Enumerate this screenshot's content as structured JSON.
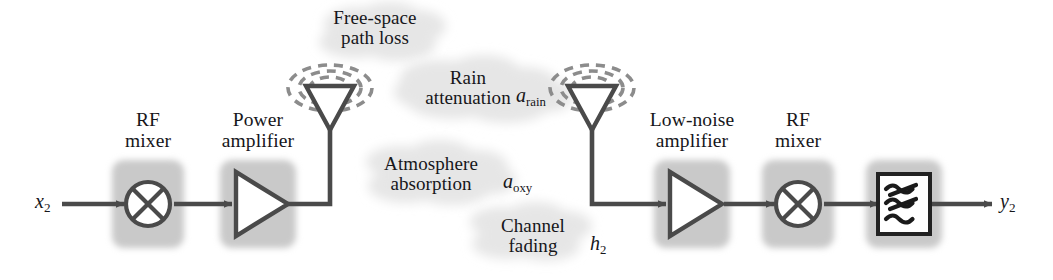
{
  "figure": {
    "kind": "rf-link-block-diagram",
    "background_color": "#ffffff",
    "line_color": "#4a4a4a",
    "block_fill_color": "#c8c8c8",
    "cloud_color": "#e3e3e3",
    "text_color": "#16161a"
  },
  "signals": {
    "input_label": "x",
    "input_subscript": "2",
    "output_label": "y",
    "output_subscript": "2"
  },
  "blocks": [
    {
      "id": "tx-rf-mixer",
      "label": "RF\nmixer",
      "icon": "mixer-circle-x-icon"
    },
    {
      "id": "power-amplifier",
      "label": "Power\namplifier",
      "icon": "amplifier-triangle-icon"
    },
    {
      "id": "low-noise-amplifier",
      "label": "Low-noise\namplifier",
      "icon": "amplifier-triangle-icon"
    },
    {
      "id": "rx-rf-mixer",
      "label": "RF\nmixer",
      "icon": "mixer-circle-x-icon"
    },
    {
      "id": "rx-filter",
      "label": "",
      "icon": "filter-wavy-lines-icon"
    }
  ],
  "antennas": [
    {
      "id": "tx-antenna",
      "name": "transmit-antenna"
    },
    {
      "id": "rx-antenna",
      "name": "receive-antenna"
    }
  ],
  "channel_effects": [
    {
      "id": "free-space-path-loss",
      "label": "Free-space\npath loss",
      "symbol": "",
      "symbol_sub": ""
    },
    {
      "id": "rain-attenuation",
      "label": "Rain\nattenuation",
      "symbol": "a",
      "symbol_sub": "rain"
    },
    {
      "id": "atmosphere-absorption",
      "label": "Atmosphere\nabsorption",
      "symbol": "a",
      "symbol_sub": "oxy"
    },
    {
      "id": "channel-fading",
      "label": "Channel\nfading",
      "symbol": "h",
      "symbol_sub": "2"
    }
  ]
}
